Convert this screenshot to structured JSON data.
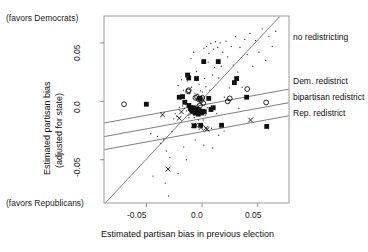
{
  "chart_data": {
    "type": "scatter",
    "title": "",
    "xlabel": "Estimated partisan bias in previous election",
    "ylabel": "Estimated partisan bias\n(adjusted for state)",
    "ylabel_line1": "Estimated partisan bias",
    "ylabel_line2": "(adjusted for state)",
    "xlim": [
      -0.088,
      0.078
    ],
    "ylim": [
      -0.087,
      0.073
    ],
    "xticks": [
      -0.05,
      0.0,
      0.05
    ],
    "xticklabels": [
      "-0.05",
      "0.0",
      "0.05"
    ],
    "yticks": [
      0.05,
      0.0,
      -0.05
    ],
    "yticklabels": [
      "0.05",
      "0.0",
      "-0.05"
    ],
    "grid": false,
    "legend_position": "right-of-axes",
    "annotations": [
      {
        "name": "favors-democrats",
        "text": "(favors Democrats)",
        "x": 0.01,
        "y": 0.205
      },
      {
        "name": "favors-republicans",
        "text": "(favors Republicans)",
        "x": 0.01,
        "y": 0.815
      }
    ],
    "fit_lines": [
      {
        "name": "no redistricting",
        "label": "no redistricting",
        "slope": 1.02,
        "intercept": 0.0015,
        "color": "#6e6e6e"
      },
      {
        "name": "Dem. redistrict",
        "label": "Dem. redistrict",
        "slope": 0.175,
        "intercept": -0.0032,
        "color": "#6e6e6e"
      },
      {
        "name": "bipartisan redistrict",
        "label": "bipartisan redistrict",
        "slope": 0.175,
        "intercept": -0.0148,
        "color": "#6e6e6e"
      },
      {
        "name": "Rep. redistrict",
        "label": "Rep. redistrict",
        "slope": 0.175,
        "intercept": -0.026,
        "color": "#6e6e6e"
      }
    ],
    "series": [
      {
        "name": "Dem. redistrict",
        "marker": "filled-square",
        "color": "#101010",
        "points": [
          [
            -0.05,
            -0.0025
          ],
          [
            -0.0205,
            0.0035
          ],
          [
            -0.0175,
            0.004
          ],
          [
            -0.0155,
            -0.0008
          ],
          [
            -0.013,
            0.0225
          ],
          [
            -0.012,
            0.02
          ],
          [
            -0.0118,
            -0.0035
          ],
          [
            -0.0105,
            -0.006
          ],
          [
            -0.0095,
            -0.007
          ],
          [
            -0.0088,
            -0.0085
          ],
          [
            -0.008,
            -0.0055
          ],
          [
            -0.0072,
            -0.021
          ],
          [
            -0.006,
            -0.01
          ],
          [
            -0.005,
            0.0195
          ],
          [
            -0.0045,
            -0.0065
          ],
          [
            -0.0035,
            -0.011
          ],
          [
            -0.0028,
            -0.0078
          ],
          [
            -0.002,
            0.0025
          ],
          [
            -0.0012,
            -0.0205
          ],
          [
            -0.0005,
            -0.01
          ],
          [
            0.0008,
            -0.0085
          ],
          [
            0.0015,
            0.034
          ],
          [
            0.002,
            -0.009
          ],
          [
            0.006,
            0.0025
          ],
          [
            0.008,
            -0.007
          ],
          [
            0.01,
            -0.0055
          ],
          [
            0.0145,
            0.034
          ],
          [
            0.0175,
            -0.0205
          ],
          [
            0.029,
            0.016
          ],
          [
            0.031,
            0.0195
          ],
          [
            0.04,
            0.0035
          ],
          [
            0.058,
            -0.0215
          ]
        ]
      },
      {
        "name": "bipartisan redistrict",
        "marker": "open-circle",
        "color": "#101010",
        "points": [
          [
            -0.07,
            -0.0025
          ],
          [
            -0.0125,
            0.0085
          ],
          [
            -0.012,
            0.0095
          ],
          [
            -0.006,
            0.003
          ],
          [
            -0.0045,
            0.0038
          ],
          [
            -0.003,
            0.0018
          ],
          [
            -0.0018,
            -0.0035
          ],
          [
            -0.0008,
            0.001
          ],
          [
            0.0002,
            0.003
          ],
          [
            0.001,
            -0.0015
          ],
          [
            0.023,
            0.0
          ],
          [
            0.0248,
            0.0025
          ],
          [
            0.0405,
            0.0105
          ],
          [
            0.0575,
            -0.001
          ]
        ]
      },
      {
        "name": "Rep. redistrict",
        "marker": "cross-x",
        "color": "#101010",
        "points": [
          [
            -0.0355,
            -0.0115
          ],
          [
            -0.0205,
            -0.0145
          ],
          [
            -0.0185,
            -0.009
          ],
          [
            -0.0095,
            -0.01
          ],
          [
            -0.0075,
            -0.0205
          ],
          [
            -0.0055,
            -0.0205
          ],
          [
            -0.001,
            -0.0225
          ],
          [
            0.0035,
            -0.023
          ],
          [
            0.0045,
            -0.024
          ],
          [
            -0.0305,
            -0.058
          ],
          [
            0.0435,
            -0.016
          ]
        ]
      },
      {
        "name": "no redistricting",
        "marker": "small-dot",
        "color": "#3a3a3a",
        "points": [
          [
            -0.046,
            -0.0275
          ],
          [
            -0.04,
            -0.03
          ],
          [
            -0.037,
            -0.036
          ],
          [
            -0.0345,
            -0.033
          ],
          [
            -0.032,
            -0.0425
          ],
          [
            -0.029,
            -0.048
          ],
          [
            -0.027,
            -0.026
          ],
          [
            -0.0255,
            -0.015
          ],
          [
            -0.024,
            -0.0105
          ],
          [
            -0.0228,
            -0.0125
          ],
          [
            -0.0215,
            0.0135
          ],
          [
            -0.0205,
            -0.005
          ],
          [
            -0.0195,
            0.005
          ],
          [
            -0.0185,
            0.0185
          ],
          [
            -0.0175,
            -0.004
          ],
          [
            -0.0168,
            0.0095
          ],
          [
            -0.0158,
            -0.006
          ],
          [
            -0.0148,
            -0.0028
          ],
          [
            -0.014,
            -0.0082
          ],
          [
            -0.0132,
            0.0175
          ],
          [
            -0.0125,
            -0.0118
          ],
          [
            -0.0118,
            -0.014
          ],
          [
            -0.011,
            0.0065
          ],
          [
            -0.01,
            0.0365
          ],
          [
            -0.0095,
            0.012
          ],
          [
            -0.0088,
            -0.0035
          ],
          [
            -0.0082,
            -0.0052
          ],
          [
            -0.0076,
            0.042
          ],
          [
            -0.007,
            -0.014
          ],
          [
            -0.0064,
            0.007
          ],
          [
            -0.0058,
            -0.0075
          ],
          [
            -0.005,
            0.0255
          ],
          [
            -0.0044,
            -0.012
          ],
          [
            -0.0038,
            0.006
          ],
          [
            -0.0032,
            -0.016
          ],
          [
            -0.0026,
            0.0145
          ],
          [
            -0.002,
            -0.006
          ],
          [
            -0.0014,
            0.009
          ],
          [
            -0.0008,
            -0.003
          ],
          [
            -0.0002,
            0.0035
          ],
          [
            0.0004,
            0.008
          ],
          [
            0.001,
            -0.016
          ],
          [
            0.0016,
            0.0455
          ],
          [
            0.0022,
            0.0195
          ],
          [
            0.0028,
            -0.012
          ],
          [
            0.0034,
            0.0125
          ],
          [
            0.004,
            0.047
          ],
          [
            0.0048,
            -0.0055
          ],
          [
            0.0055,
            0.0335
          ],
          [
            0.0062,
            0.041
          ],
          [
            0.007,
            0.0095
          ],
          [
            0.0078,
            0.0495
          ],
          [
            0.0086,
            -0.023
          ],
          [
            0.0094,
            0.0225
          ],
          [
            0.0102,
            0.0445
          ],
          [
            0.0112,
            0.029
          ],
          [
            0.012,
            0.051
          ],
          [
            0.013,
            -0.0105
          ],
          [
            0.014,
            0.046
          ],
          [
            0.015,
            0.02
          ],
          [
            0.0162,
            0.05
          ],
          [
            0.0172,
            0.03
          ],
          [
            0.0185,
            0.042
          ],
          [
            0.0198,
            -0.0255
          ],
          [
            0.0215,
            0.0515
          ],
          [
            0.023,
            0.038
          ],
          [
            0.0245,
            0.0115
          ],
          [
            0.0262,
            0.047
          ],
          [
            0.028,
            0.031
          ],
          [
            0.03,
            0.0555
          ],
          [
            0.032,
            0.025
          ],
          [
            0.034,
            0.046
          ],
          [
            0.036,
            0.012
          ],
          [
            0.0382,
            0.053
          ],
          [
            0.0405,
            0.04
          ],
          [
            0.043,
            0.058
          ],
          [
            0.0455,
            0.03
          ],
          [
            0.048,
            0.052
          ],
          [
            0.051,
            0.042
          ],
          [
            0.054,
            0.062
          ],
          [
            0.057,
            0.035
          ],
          [
            0.06,
            0.0555
          ],
          [
            0.063,
            0.047
          ],
          [
            0.066,
            0.06
          ],
          [
            -0.044,
            -0.064
          ],
          [
            -0.033,
            -0.07
          ],
          [
            -0.0215,
            -0.062
          ],
          [
            -0.014,
            -0.05
          ],
          [
            -0.03,
            -0.081
          ],
          [
            -0.0062,
            -0.033
          ],
          [
            0.0016,
            -0.0375
          ],
          [
            0.0095,
            -0.04
          ],
          [
            -0.0165,
            -0.039
          ],
          [
            0.02,
            0.0035
          ],
          [
            0.033,
            -0.006
          ],
          [
            0.015,
            -0.029
          ]
        ]
      }
    ]
  },
  "axes_geometry": {
    "left": 104,
    "right": 289,
    "top": 16,
    "bottom": 203
  }
}
